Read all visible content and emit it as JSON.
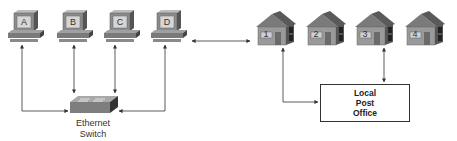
{
  "computers": [
    {
      "label": "A"
    },
    {
      "label": "B"
    },
    {
      "label": "C"
    },
    {
      "label": "D"
    }
  ],
  "switch": {
    "line1": "Ethernet",
    "line2": "Switch"
  },
  "houses": [
    {
      "label": "1"
    },
    {
      "label": "2"
    },
    {
      "label": "3"
    },
    {
      "label": "4"
    }
  ],
  "post_office": {
    "line1": "Local",
    "line2": "Post",
    "line3": "Office"
  },
  "colors": {
    "device_gray": "#8a8a8a",
    "roof_gray": "#6e6e6e",
    "line": "#333333"
  }
}
